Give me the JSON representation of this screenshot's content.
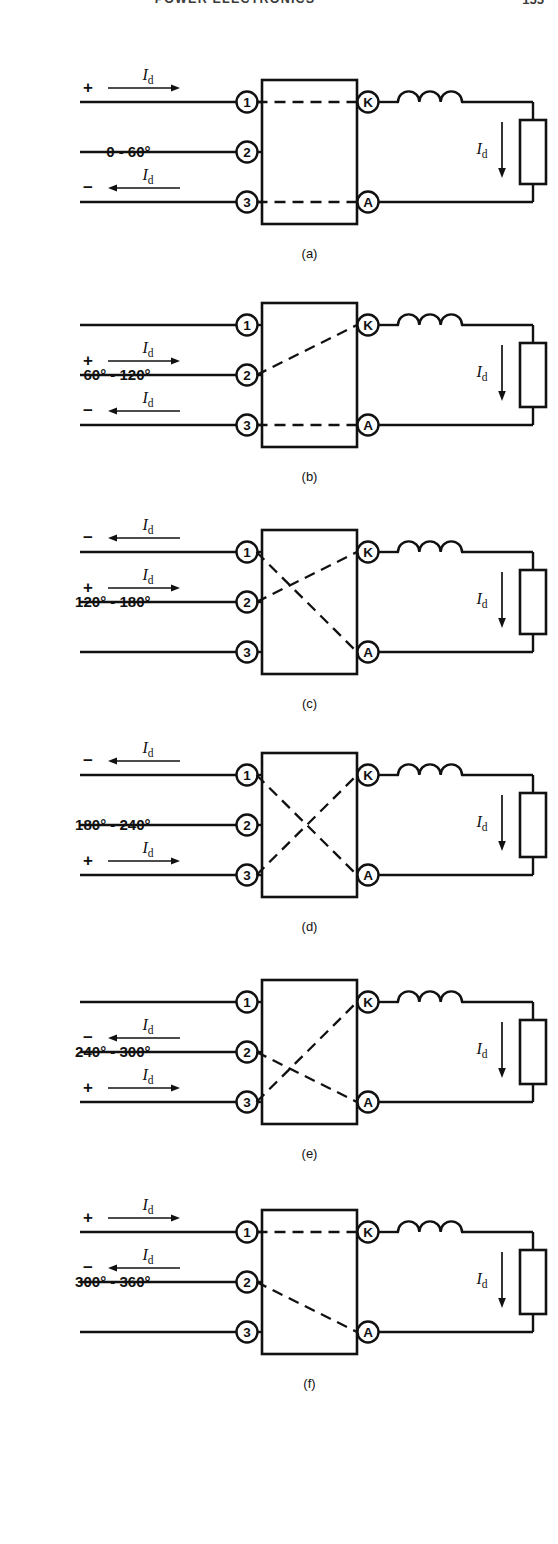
{
  "header": {
    "title": "POWER ELECTRONICS",
    "page_number": "155"
  },
  "labels": {
    "current": "I",
    "current_sub": "d",
    "plus": "+",
    "minus": "−",
    "terminal_1": "1",
    "terminal_2": "2",
    "terminal_3": "3",
    "cathode": "K",
    "anode": "A"
  },
  "figures": [
    {
      "id": "a",
      "caption": "(a)",
      "angle_label": "0 - 60°",
      "angle_row": 2,
      "conduction": [
        {
          "from": "1",
          "to": "K"
        },
        {
          "from": "3",
          "to": "A"
        }
      ],
      "polarity": [
        {
          "terminal": "1",
          "sign": "+",
          "arrow": "right",
          "current": "Id"
        },
        {
          "terminal": "3",
          "sign": "−",
          "arrow": "left",
          "current": "Id"
        }
      ],
      "load_current": "Id"
    },
    {
      "id": "b",
      "caption": "(b)",
      "angle_label": "60° - 120°",
      "angle_row": 2,
      "conduction": [
        {
          "from": "2",
          "to": "K"
        },
        {
          "from": "3",
          "to": "A"
        }
      ],
      "polarity": [
        {
          "terminal": "2",
          "sign": "+",
          "arrow": "right",
          "current": "Id"
        },
        {
          "terminal": "3",
          "sign": "−",
          "arrow": "left",
          "current": "Id"
        }
      ],
      "load_current": "Id"
    },
    {
      "id": "c",
      "caption": "(c)",
      "angle_label": "120° - 180°",
      "angle_row": 2,
      "conduction": [
        {
          "from": "2",
          "to": "K"
        },
        {
          "from": "1",
          "to": "A"
        }
      ],
      "polarity": [
        {
          "terminal": "1",
          "sign": "−",
          "arrow": "left",
          "current": "Id"
        },
        {
          "terminal": "2",
          "sign": "+",
          "arrow": "right",
          "current": "Id"
        }
      ],
      "load_current": "Id"
    },
    {
      "id": "d",
      "caption": "(d)",
      "angle_label": "180° - 240°",
      "angle_row": 2,
      "conduction": [
        {
          "from": "3",
          "to": "K"
        },
        {
          "from": "1",
          "to": "A"
        }
      ],
      "polarity": [
        {
          "terminal": "1",
          "sign": "−",
          "arrow": "left",
          "current": "Id"
        },
        {
          "terminal": "3",
          "sign": "+",
          "arrow": "right",
          "current": "Id"
        }
      ],
      "load_current": "Id"
    },
    {
      "id": "e",
      "caption": "(e)",
      "angle_label": "240° - 300°",
      "angle_row": 2,
      "conduction": [
        {
          "from": "3",
          "to": "K"
        },
        {
          "from": "2",
          "to": "A"
        }
      ],
      "polarity": [
        {
          "terminal": "2",
          "sign": "−",
          "arrow": "left",
          "current": "Id"
        },
        {
          "terminal": "3",
          "sign": "+",
          "arrow": "right",
          "current": "Id"
        }
      ],
      "load_current": "Id"
    },
    {
      "id": "f",
      "caption": "(f)",
      "angle_label": "300° - 360°",
      "angle_row": 2,
      "conduction": [
        {
          "from": "1",
          "to": "K"
        },
        {
          "from": "2",
          "to": "A"
        }
      ],
      "polarity": [
        {
          "terminal": "1",
          "sign": "+",
          "arrow": "right",
          "current": "Id"
        },
        {
          "terminal": "2",
          "sign": "−",
          "arrow": "left",
          "current": "Id"
        }
      ],
      "load_current": "Id"
    }
  ],
  "colors": {
    "ink": "#111111",
    "background": "#ffffff",
    "header_ink": "#3a3a3a"
  }
}
